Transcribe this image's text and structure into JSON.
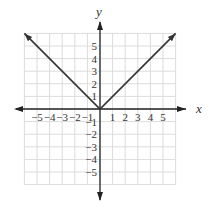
{
  "chart_data": {
    "type": "line",
    "title": "",
    "function": "y = |x|",
    "xlabel": "x",
    "ylabel": "y",
    "xlim": [
      -6,
      6
    ],
    "ylim": [
      -6,
      6
    ],
    "grid": true,
    "x_ticks": [
      "−5",
      "−4",
      "−3",
      "−2",
      "−1",
      "1",
      "2",
      "3",
      "4",
      "5"
    ],
    "y_ticks": [
      "5",
      "4",
      "3",
      "2",
      "1",
      "−1",
      "−2",
      "−3",
      "−4",
      "−5"
    ],
    "series": [
      {
        "name": "y = |x|",
        "x": [
          -6,
          0,
          6
        ],
        "y": [
          6,
          0,
          6
        ],
        "color": "#333333",
        "arrows": "both"
      }
    ]
  },
  "labels": {
    "x_axis": "x",
    "y_axis": "y"
  }
}
